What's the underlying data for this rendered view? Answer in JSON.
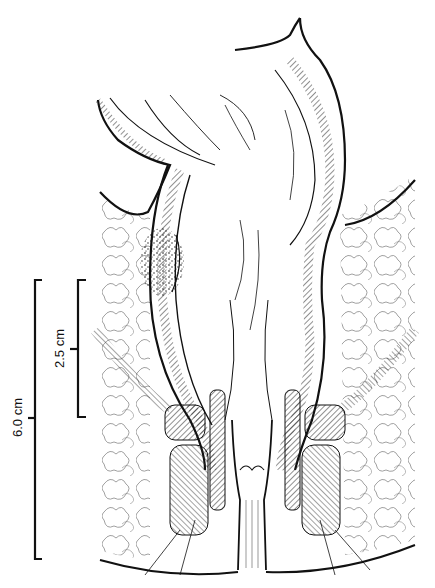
{
  "figure": {
    "type": "anatomical line illustration",
    "colors": {
      "ink": "#111111",
      "background": "#ffffff",
      "fine_line": "#555555"
    }
  },
  "scale_bars": [
    {
      "id": "outer",
      "label": "6.0 cm",
      "x": 35,
      "y_top": 280,
      "y_bottom": 559
    },
    {
      "id": "inner",
      "label": "2.5 cm",
      "x": 78,
      "y_top": 280,
      "y_bottom": 417
    }
  ],
  "labels": {
    "outer_scale": "6.0 cm",
    "inner_scale": "2.5 cm"
  }
}
